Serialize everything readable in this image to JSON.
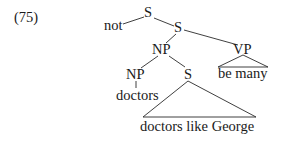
{
  "example_number": "(75)",
  "tree": {
    "nodes": {
      "root_s": "S",
      "neg": "not",
      "inner_s": "S",
      "np_upper": "NP",
      "vp": "VP",
      "vp_yield": "be many",
      "np_lower": "NP",
      "np_lower_word": "doctors",
      "rel_s": "S",
      "rel_s_yield": "doctors like George"
    },
    "structure": "[S not [S [NP [NP doctors] [S doctors like George]] [VP be many]]]"
  }
}
